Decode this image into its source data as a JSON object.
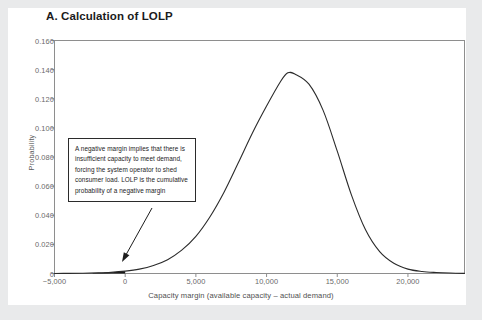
{
  "page": {
    "background_color": "#e9eaeb",
    "card_color": "#ffffff"
  },
  "title": "A. Calculation of LOLP",
  "annotation": {
    "text": "A negative margin implies that there is insufficient capacity to meet demand, forcing the system  operator to shed consumer load. LOLP is the cumulative probability of a negative margin",
    "arrow_from": [
      152,
      208
    ],
    "arrow_to": [
      122,
      262
    ]
  },
  "chart_data": {
    "type": "area",
    "title": "A. Calculation of LOLP",
    "xlabel": "Capacity margin (available capacity – actual demand)",
    "ylabel": "Probability",
    "xlim": [
      -5000,
      24000
    ],
    "ylim": [
      0,
      0.16
    ],
    "grid": false,
    "legend": null,
    "x_ticks": [
      -5000,
      0,
      5000,
      10000,
      15000,
      20000
    ],
    "x_tick_labels": [
      "−5,000",
      "0",
      "5,000",
      "10,000",
      "15,000",
      "20,000"
    ],
    "y_ticks": [
      0,
      0.02,
      0.04,
      0.06,
      0.08,
      0.1,
      0.12,
      0.14,
      0.16
    ],
    "y_tick_labels": [
      "0",
      "0.020",
      "0.040",
      "0.060",
      "0.080",
      "0.100",
      "0.120",
      "0.140",
      "0.160"
    ],
    "series": [
      {
        "name": "Probability density of capacity margin",
        "type": "line",
        "color": "#2b2b2b",
        "x": [
          -5000,
          -4000,
          -3000,
          -2000,
          -1000,
          0,
          1000,
          2000,
          3000,
          4000,
          5000,
          6000,
          7000,
          8000,
          9000,
          10000,
          11000,
          11500,
          12000,
          13000,
          14000,
          15000,
          16000,
          17000,
          18000,
          19000,
          20000,
          21000,
          22000,
          23000,
          24000
        ],
        "y": [
          0.0,
          0.0001,
          0.0002,
          0.0004,
          0.0008,
          0.0016,
          0.003,
          0.0055,
          0.0095,
          0.016,
          0.0255,
          0.039,
          0.056,
          0.076,
          0.0965,
          0.115,
          0.132,
          0.1378,
          0.137,
          0.13,
          0.112,
          0.084,
          0.054,
          0.03,
          0.015,
          0.007,
          0.003,
          0.0014,
          0.0007,
          0.0003,
          0.0001
        ]
      }
    ],
    "shaded_region": {
      "name": "negative margin tail (LOLP)",
      "color": "#1a1a1a",
      "x_from": -2300,
      "x_to": 0,
      "description": "Cumulative probability of a negative capacity margin"
    },
    "peak": {
      "x": 11500,
      "y": 0.138
    }
  }
}
